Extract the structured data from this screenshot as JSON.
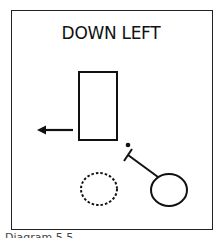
{
  "diagram": {
    "title": "DOWN LEFT",
    "caption": "Diagram 5.5",
    "elements": [
      {
        "type": "rectangle",
        "label": "object-rectangle"
      },
      {
        "type": "arrow",
        "direction": "left"
      },
      {
        "type": "dot"
      },
      {
        "type": "club",
        "shape": "stick-with-crossbar"
      },
      {
        "type": "circle",
        "style": "solid",
        "label": "ball"
      },
      {
        "type": "circle",
        "style": "dashed",
        "label": "target-position"
      }
    ],
    "colors": {
      "stroke": "#111111",
      "background": "#ffffff"
    }
  }
}
